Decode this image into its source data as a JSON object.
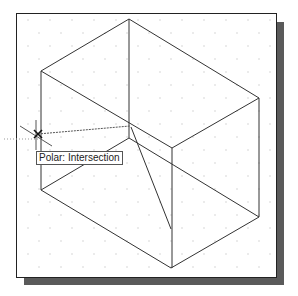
{
  "viewport": {
    "background": "#ffffff",
    "grid_style": "isometric-dots",
    "geometry_color": "#333333"
  },
  "tooltip": {
    "label": "Polar: Intersection"
  },
  "cursor": {
    "marker": "intersection-x-marker"
  }
}
